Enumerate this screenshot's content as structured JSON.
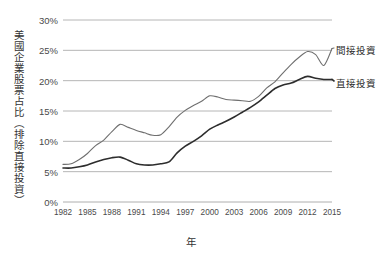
{
  "chart_data": {
    "type": "line",
    "title": "",
    "xlabel": "年",
    "ylabel": "美國企業股票占比（排除直接投資）",
    "xlim": [
      1982,
      2015
    ],
    "ylim": [
      0,
      30
    ],
    "grid": true,
    "legend_position": "right-inline",
    "x_tick_labels": [
      "1982",
      "1985",
      "1988",
      "1991",
      "1994",
      "1997",
      "2000",
      "2003",
      "2006",
      "2009",
      "2012",
      "2015"
    ],
    "y_tick_labels": [
      "0%",
      "5%",
      "10%",
      "15%",
      "20%",
      "25%",
      "30%"
    ],
    "y_tick_values": [
      0,
      5,
      10,
      15,
      20,
      25,
      30
    ],
    "x": [
      1982,
      1983,
      1984,
      1985,
      1986,
      1987,
      1988,
      1989,
      1990,
      1991,
      1992,
      1993,
      1994,
      1995,
      1996,
      1997,
      1998,
      1999,
      2000,
      2001,
      2002,
      2003,
      2004,
      2005,
      2006,
      2007,
      2008,
      2009,
      2010,
      2011,
      2012,
      2013,
      2014,
      2015
    ],
    "series": [
      {
        "name": "間接投資",
        "color": "#6f6f6f",
        "width": 1.1,
        "values": [
          6.2,
          6.3,
          7.0,
          8.0,
          9.3,
          10.2,
          11.6,
          12.8,
          12.3,
          11.8,
          11.4,
          11.0,
          11.1,
          12.4,
          14.0,
          15.1,
          15.9,
          16.6,
          17.5,
          17.3,
          16.9,
          16.8,
          16.7,
          16.6,
          17.4,
          18.8,
          19.8,
          21.3,
          22.7,
          23.9,
          24.8,
          24.3,
          22.5,
          25.3
        ]
      },
      {
        "name": "直接投資",
        "color": "#2d2d2d",
        "width": 1.6,
        "values": [
          5.6,
          5.6,
          5.8,
          6.1,
          6.6,
          7.0,
          7.3,
          7.4,
          6.9,
          6.3,
          6.1,
          6.1,
          6.3,
          6.6,
          8.1,
          9.2,
          10.0,
          10.9,
          12.0,
          12.7,
          13.3,
          14.0,
          14.8,
          15.6,
          16.5,
          17.6,
          18.7,
          19.3,
          19.6,
          20.2,
          20.7,
          20.4,
          20.2,
          20.2
        ]
      }
    ],
    "legend": [
      {
        "label": "間接投資",
        "color": "#6f6f6f"
      },
      {
        "label": "直接投資",
        "color": "#2d2d2d"
      }
    ]
  },
  "axes": {
    "plot_left": 63,
    "plot_right": 332,
    "plot_top": 20,
    "plot_bottom": 202,
    "gridline_color": "#aeaeae"
  }
}
